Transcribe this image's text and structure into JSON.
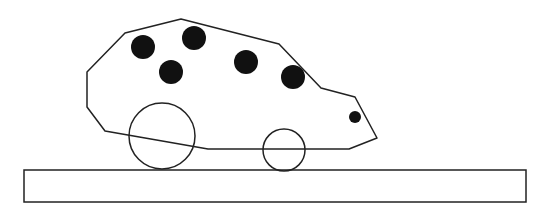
{
  "figure": {
    "colors": {
      "stroke": "#222222",
      "fill_spots": "#111111",
      "background": "#ffffff"
    },
    "body_points": "125,33 181,19 279,44 321,88 355,97 377,138 349,149 208,149 105,131 87,107 87,72",
    "spots": [
      {
        "cx": 143,
        "cy": 47,
        "r": 12
      },
      {
        "cx": 194,
        "cy": 38,
        "r": 12
      },
      {
        "cx": 171,
        "cy": 72,
        "r": 12
      },
      {
        "cx": 246,
        "cy": 62,
        "r": 12
      },
      {
        "cx": 293,
        "cy": 77,
        "r": 12
      },
      {
        "cx": 355,
        "cy": 117,
        "r": 6
      }
    ],
    "wheels": [
      {
        "name": "rear-wheel",
        "cx": 162,
        "cy": 136,
        "r": 33
      },
      {
        "name": "front-wheel",
        "cx": 284,
        "cy": 150,
        "r": 21
      }
    ],
    "platform": {
      "x": 24,
      "y": 170,
      "width": 502,
      "height": 32
    }
  }
}
